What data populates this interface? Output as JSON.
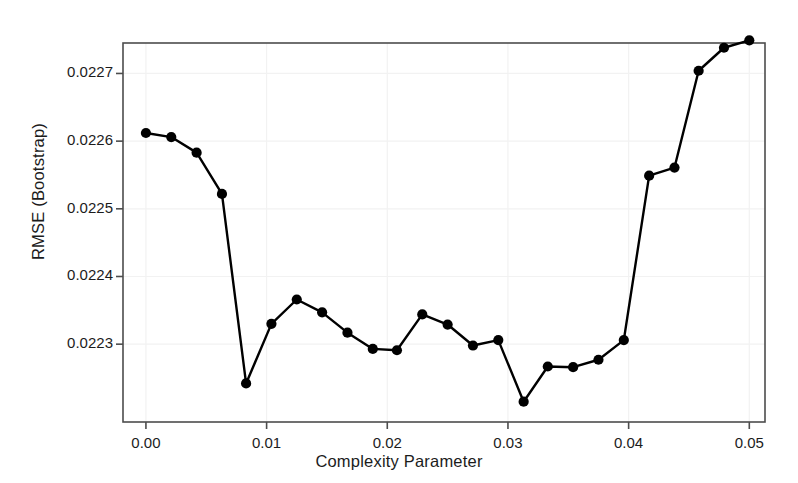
{
  "chart_data": {
    "type": "line",
    "title": "",
    "xlabel": "Complexity Parameter",
    "ylabel": "RMSE (Bootstrap)",
    "xlim": [
      -0.0019,
      0.0513
    ],
    "ylim": [
      0.022185,
      0.022745
    ],
    "xticks": [
      0.0,
      0.01,
      0.02,
      0.03,
      0.04,
      0.05
    ],
    "xtick_labels": [
      "0.00",
      "0.01",
      "0.02",
      "0.03",
      "0.04",
      "0.05"
    ],
    "yticks": [
      0.0223,
      0.0224,
      0.0225,
      0.0226,
      0.0227
    ],
    "ytick_labels": [
      "0.0223",
      "0.0224",
      "0.0225",
      "0.0226",
      "0.0227"
    ],
    "grid": true,
    "grid_color": "#f2f2f2",
    "legend": null,
    "marker": "filled-circle",
    "marker_color": "#000000",
    "line_color": "#000000",
    "x": [
      0.0,
      0.0021,
      0.0042,
      0.0063,
      0.0083,
      0.0104,
      0.0125,
      0.0146,
      0.0167,
      0.0188,
      0.0208,
      0.0229,
      0.025,
      0.0271,
      0.0292,
      0.0313,
      0.0333,
      0.0354,
      0.0375,
      0.0396,
      0.0417,
      0.0438,
      0.0458,
      0.0479,
      0.05
    ],
    "y": [
      0.022612,
      0.022606,
      0.022583,
      0.022522,
      0.022242,
      0.02233,
      0.022366,
      0.022347,
      0.022317,
      0.022293,
      0.022291,
      0.022344,
      0.022329,
      0.022298,
      0.022306,
      0.022215,
      0.022267,
      0.022266,
      0.022277,
      0.022306,
      0.022549,
      0.022561,
      0.022704,
      0.022738,
      0.022749
    ],
    "series_label": "RMSE (Bootstrap) vs Complexity Parameter",
    "n_points": 25
  },
  "plot_area": {
    "left": 123,
    "top": 43,
    "right": 765,
    "bottom": 422
  }
}
